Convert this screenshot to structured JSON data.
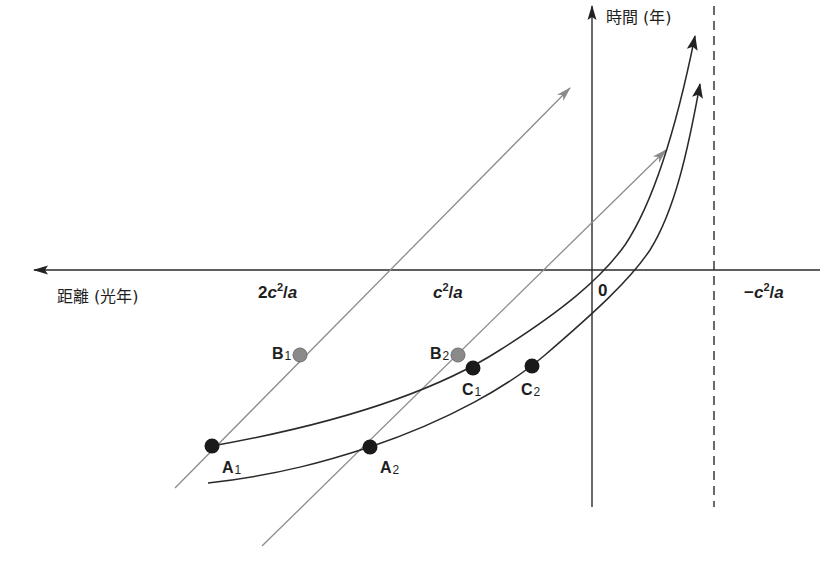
{
  "axes": {
    "x_label": "距離 (光年)",
    "y_label": "時間 (年)",
    "x_ticks": [
      {
        "id": "2c2a",
        "prefix": "2",
        "var": "c",
        "exp": "2",
        "suffix": "/",
        "den": "a"
      },
      {
        "id": "c2a",
        "prefix": "",
        "var": "c",
        "exp": "2",
        "suffix": "/",
        "den": "a"
      },
      {
        "id": "zero",
        "text": "0"
      },
      {
        "id": "neg_c2a",
        "prefix": "−",
        "var": "c",
        "exp": "2",
        "suffix": "/",
        "den": "a"
      }
    ]
  },
  "points": {
    "A1": {
      "letter": "A",
      "sub": "1",
      "color": "#1a1a1a"
    },
    "A2": {
      "letter": "A",
      "sub": "2",
      "color": "#1a1a1a"
    },
    "B1": {
      "letter": "B",
      "sub": "1",
      "color": "#8a8a8a"
    },
    "B2": {
      "letter": "B",
      "sub": "2",
      "color": "#8a8a8a"
    },
    "C1": {
      "letter": "C",
      "sub": "1",
      "color": "#1a1a1a"
    },
    "C2": {
      "letter": "C",
      "sub": "2",
      "color": "#1a1a1a"
    }
  },
  "colors": {
    "axis": "#2a2a2a",
    "curve": "#2a2a2a",
    "light_ray": "#8c8c8c",
    "asymptote": "#2a2a2a"
  }
}
